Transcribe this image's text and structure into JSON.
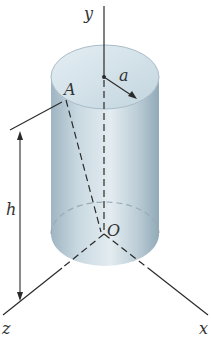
{
  "figure": {
    "labels": {
      "y_axis": "y",
      "x_axis": "x",
      "z_axis": "z",
      "radius": "a",
      "height": "h",
      "point_A": "A",
      "origin": "O"
    },
    "colors": {
      "cylinder_light": "#dfe9ee",
      "cylinder_mid": "#b9cbd6",
      "cylinder_dark": "#8ea6b5",
      "top_face": "#d3e2ea",
      "line": "#2a2a2a"
    }
  }
}
